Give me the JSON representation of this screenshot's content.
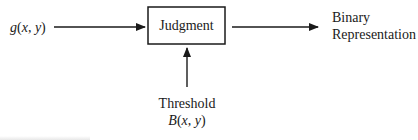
{
  "diagram": {
    "input_label": "g(x, y)",
    "process_label": "Judgment",
    "output_label_line1": "Binary",
    "output_label_line2": "Representation",
    "threshold_label": "Threshold",
    "threshold_symbol": "B(x, y)",
    "colors": {
      "line": "#1a1a1a",
      "text": "#1a1a1a",
      "background": "#ffffff"
    },
    "edges": [
      {
        "from": "g(x, y)",
        "to": "Judgment"
      },
      {
        "from": "Judgment",
        "to": "Binary Representation"
      },
      {
        "from": "Threshold B(x, y)",
        "to": "Judgment"
      }
    ]
  }
}
